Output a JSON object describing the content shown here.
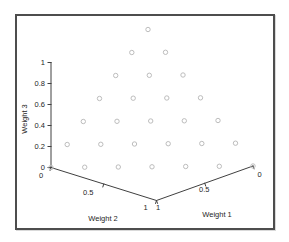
{
  "figure": {
    "background": "#ffffff",
    "border_color": "#4d4d4d"
  },
  "chart_data": {
    "type": "scatter",
    "subtype": "3d-simplex-scatter",
    "title": "",
    "axes": {
      "weight1": {
        "label": "Weight 1",
        "range": [
          0,
          1
        ],
        "ticks": [
          "1",
          "0.5",
          "0"
        ]
      },
      "weight2": {
        "label": "Weight 2",
        "range": [
          0,
          1
        ],
        "ticks": [
          "0",
          "0.5",
          "1"
        ]
      },
      "weight3": {
        "label": "Weight 3",
        "range": [
          0,
          1
        ],
        "ticks": [
          "0",
          "0.2",
          "0.4",
          "0.6",
          "0.8",
          "1"
        ]
      }
    },
    "grid": false,
    "legend": null,
    "marker": {
      "shape": "open-circle",
      "color": "#bdbdbd",
      "diameter_px": 5
    },
    "style": {
      "axis_color": "#404040",
      "text_color": "#262626"
    },
    "points": [
      [
        1,
        0,
        0
      ],
      [
        0.8333,
        0.1667,
        0
      ],
      [
        0.6667,
        0.3333,
        0
      ],
      [
        0.5,
        0.5,
        0
      ],
      [
        0.3333,
        0.6667,
        0
      ],
      [
        0.1667,
        0.8333,
        0
      ],
      [
        0,
        1,
        0
      ],
      [
        0.8333,
        0,
        0.1667
      ],
      [
        0.6667,
        0.1667,
        0.1667
      ],
      [
        0.5,
        0.3333,
        0.1667
      ],
      [
        0.3333,
        0.5,
        0.1667
      ],
      [
        0.1667,
        0.6667,
        0.1667
      ],
      [
        0,
        0.8333,
        0.1667
      ],
      [
        0.6667,
        0,
        0.3333
      ],
      [
        0.5,
        0.1667,
        0.3333
      ],
      [
        0.3333,
        0.3333,
        0.3333
      ],
      [
        0.1667,
        0.5,
        0.3333
      ],
      [
        0,
        0.6667,
        0.3333
      ],
      [
        0.5,
        0,
        0.5
      ],
      [
        0.3333,
        0.1667,
        0.5
      ],
      [
        0.1667,
        0.3333,
        0.5
      ],
      [
        0,
        0.5,
        0.5
      ],
      [
        0.3333,
        0,
        0.6667
      ],
      [
        0.1667,
        0.1667,
        0.6667
      ],
      [
        0,
        0.3333,
        0.6667
      ],
      [
        0.1667,
        0,
        0.8333
      ],
      [
        0,
        0.1667,
        0.8333
      ],
      [
        0,
        0,
        1
      ]
    ]
  }
}
